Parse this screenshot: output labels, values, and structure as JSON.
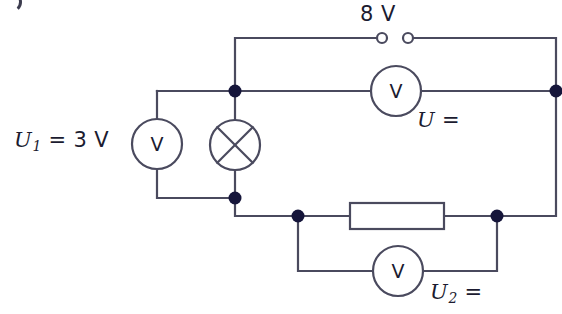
{
  "diagram": {
    "type": "electrical-circuit-schematic",
    "wire_color": "#4a4a5e",
    "node_color": "#15153a",
    "text_color": "#1b1b30",
    "background": "#ffffff"
  },
  "labels": {
    "source_voltage": "8 V",
    "u1_value": "3 V",
    "u1_symbol": "U",
    "u1_subscript": "1",
    "u1_equals": "=",
    "u_symbol": "U",
    "u_equals": "=",
    "u2_symbol": "U",
    "u2_subscript": "2",
    "u2_equals": "="
  },
  "components": [
    {
      "id": "source-terminals",
      "name": "voltage-source-terminals",
      "symbol": "open-terminals",
      "label": "8 V",
      "x": 395,
      "y": 38
    },
    {
      "id": "voltmeter-u1",
      "name": "voltmeter-u1",
      "symbol": "V",
      "label": "U1 = 3 V",
      "x": 157,
      "y": 144,
      "orientation": "vertical"
    },
    {
      "id": "lamp",
      "name": "lamp",
      "symbol": "circle-with-cross",
      "label": "",
      "x": 235,
      "y": 145,
      "orientation": "vertical"
    },
    {
      "id": "voltmeter-u",
      "name": "voltmeter-u-total",
      "symbol": "V",
      "label": "U =",
      "x": 396,
      "y": 91,
      "orientation": "horizontal"
    },
    {
      "id": "resistor",
      "name": "resistor",
      "symbol": "rectangle",
      "label": "",
      "x": 397,
      "y": 216,
      "orientation": "horizontal"
    },
    {
      "id": "voltmeter-u2",
      "name": "voltmeter-u2",
      "symbol": "V",
      "label": "U2 =",
      "x": 398,
      "y": 271,
      "orientation": "horizontal"
    }
  ],
  "nodes": [
    {
      "name": "node-top-left",
      "x": 235,
      "y": 91
    },
    {
      "name": "node-top-right",
      "x": 556,
      "y": 91
    },
    {
      "name": "node-mid-left",
      "x": 235,
      "y": 198
    },
    {
      "name": "node-bottom-left",
      "x": 298,
      "y": 216
    },
    {
      "name": "node-bottom-right",
      "x": 497,
      "y": 216
    }
  ]
}
